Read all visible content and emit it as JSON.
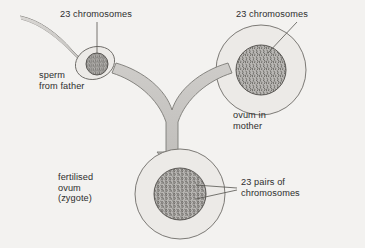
{
  "diagram": {
    "background_color": "#f3f2f0",
    "ink_color": "#2e2e2e",
    "cell_fill": "#eceae7",
    "nucleus_fill": "#b9b7b4",
    "arrow_fill": "#c9c7c4",
    "labels": {
      "sperm_chromosomes": "23 chromosomes",
      "sperm_cell": "sperm\nfrom father",
      "ovum_chromosomes": "23 chromosomes",
      "ovum_cell": "ovum in\nmother",
      "zygote_cell": "fertilised\novum\n(zygote)",
      "zygote_chromosomes": "23 pairs of\nchromosomes"
    },
    "parts": [
      {
        "name": "sperm",
        "chromosome_count": "23",
        "chromosome_state": "single"
      },
      {
        "name": "ovum",
        "chromosome_count": "23",
        "chromosome_state": "single"
      },
      {
        "name": "zygote",
        "chromosome_count": "23 pairs",
        "chromosome_state": "paired"
      }
    ]
  }
}
